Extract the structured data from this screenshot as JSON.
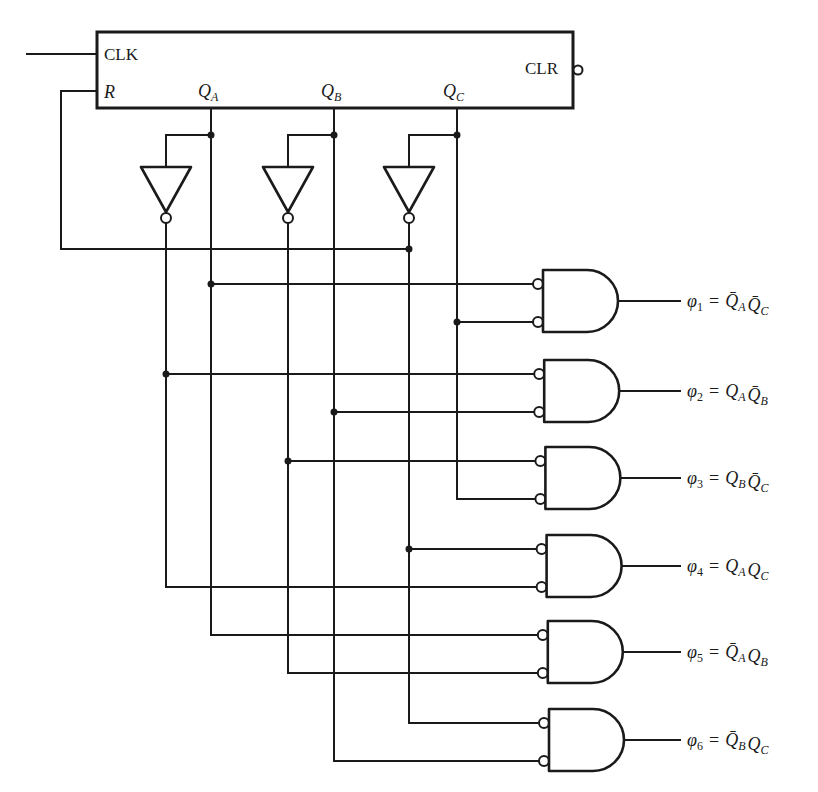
{
  "figure": {
    "counter": {
      "inputs": {
        "clock": "CLK",
        "reset": "R",
        "clear": "CLR"
      },
      "outputs": [
        {
          "id": "QA",
          "base": "Q",
          "sub": "A"
        },
        {
          "id": "QB",
          "base": "Q",
          "sub": "B"
        },
        {
          "id": "QC",
          "base": "Q",
          "sub": "C"
        }
      ],
      "clear_active_low": true
    },
    "inverters": [
      {
        "input": "QA",
        "output": "notQA"
      },
      {
        "input": "QB",
        "output": "notQB"
      },
      {
        "input": "QC",
        "output": "notQC"
      }
    ],
    "reset_feedback_source": "notQC",
    "gates": [
      {
        "type": "AND",
        "inverted_inputs": true,
        "inputs": [
          "QA",
          "QC"
        ],
        "output": {
          "symbol": "φ",
          "index": "1",
          "terms": [
            {
              "base": "Q",
              "sub": "A",
              "bar": true
            },
            {
              "base": "Q",
              "sub": "C",
              "bar": true
            }
          ]
        }
      },
      {
        "type": "AND",
        "inverted_inputs": true,
        "inputs": [
          "notQA",
          "QB"
        ],
        "output": {
          "symbol": "φ",
          "index": "2",
          "terms": [
            {
              "base": "Q",
              "sub": "A",
              "bar": false
            },
            {
              "base": "Q",
              "sub": "B",
              "bar": true
            }
          ]
        }
      },
      {
        "type": "AND",
        "inverted_inputs": true,
        "inputs": [
          "notQB",
          "QC"
        ],
        "output": {
          "symbol": "φ",
          "index": "3",
          "terms": [
            {
              "base": "Q",
              "sub": "B",
              "bar": false
            },
            {
              "base": "Q",
              "sub": "C",
              "bar": true
            }
          ]
        }
      },
      {
        "type": "AND",
        "inverted_inputs": true,
        "inputs": [
          "notQC",
          "notQA"
        ],
        "output": {
          "symbol": "φ",
          "index": "4",
          "terms": [
            {
              "base": "Q",
              "sub": "A",
              "bar": false
            },
            {
              "base": "Q",
              "sub": "C",
              "bar": false
            }
          ]
        }
      },
      {
        "type": "AND",
        "inverted_inputs": true,
        "inputs": [
          "QA",
          "notQB"
        ],
        "output": {
          "symbol": "φ",
          "index": "5",
          "terms": [
            {
              "base": "Q",
              "sub": "A",
              "bar": true
            },
            {
              "base": "Q",
              "sub": "B",
              "bar": false
            }
          ]
        }
      },
      {
        "type": "AND",
        "inverted_inputs": true,
        "inputs": [
          "notQC",
          "QB"
        ],
        "output": {
          "symbol": "φ",
          "index": "6",
          "terms": [
            {
              "base": "Q",
              "sub": "B",
              "bar": true
            },
            {
              "base": "Q",
              "sub": "C",
              "bar": false
            }
          ]
        }
      }
    ],
    "equals_sign": "="
  },
  "colors": {
    "ink": "#1a1a1a",
    "background": "#ffffff"
  }
}
